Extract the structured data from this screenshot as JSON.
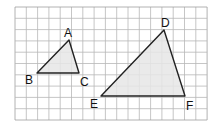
{
  "grid": {
    "x0": 15,
    "y0": 7,
    "cols": 17,
    "rows": 10,
    "cell": 11.3,
    "line_color": "#b8b8b8",
    "border_color": "#a0a0a0"
  },
  "fill_color": "#e6e6e6",
  "stroke_color": "#222222",
  "triangles": [
    {
      "name": "ABC",
      "points": [
        [
          69,
          40
        ],
        [
          37,
          73
        ],
        [
          79,
          73
        ]
      ]
    },
    {
      "name": "DEF",
      "points": [
        [
          164,
          30
        ],
        [
          101,
          96
        ],
        [
          185,
          96
        ]
      ]
    }
  ],
  "labels": [
    {
      "text": "A",
      "x": 64,
      "y": 37
    },
    {
      "text": "B",
      "x": 25,
      "y": 84
    },
    {
      "text": "C",
      "x": 80,
      "y": 86
    },
    {
      "text": "D",
      "x": 161,
      "y": 27
    },
    {
      "text": "E",
      "x": 90,
      "y": 108
    },
    {
      "text": "F",
      "x": 186,
      "y": 110
    }
  ]
}
